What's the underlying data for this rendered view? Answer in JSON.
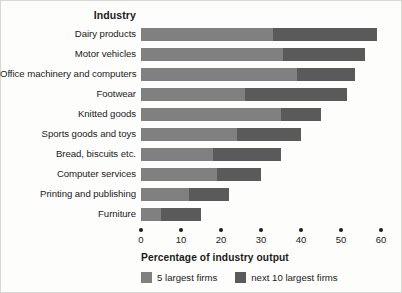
{
  "header": {
    "category_header": "Industry"
  },
  "axis": {
    "title": "Percentage of industry output",
    "ticks": [
      "0",
      "10",
      "20",
      "30",
      "40",
      "50",
      "60"
    ]
  },
  "legend": {
    "items": [
      {
        "label": "5 largest firms",
        "color": "#808080",
        "swatch_name": "legend-swatch-five-largest"
      },
      {
        "label": "next 10 largest firms",
        "color": "#5a5a5a",
        "swatch_name": "legend-swatch-next-ten"
      }
    ]
  },
  "colors": {
    "series_a": "#808080",
    "series_b": "#5a5a5a",
    "text": "#1b1b1b",
    "background": "#fdfdfc"
  },
  "chart_data": {
    "type": "bar",
    "orientation": "horizontal",
    "stacked": true,
    "title": "",
    "xlabel": "Percentage of industry output",
    "ylabel": "Industry",
    "xlim": [
      0,
      60
    ],
    "xticks": [
      0,
      10,
      20,
      30,
      40,
      50,
      60
    ],
    "grid": false,
    "legend_position": "bottom",
    "categories": [
      "Dairy products",
      "Motor vehicles",
      "Office machinery and computers",
      "Footwear",
      "Knitted goods",
      "Sports goods and toys",
      "Bread, biscuits etc.",
      "Computer services",
      "Printing and publishing",
      "Furniture"
    ],
    "series": [
      {
        "name": "5 largest firms",
        "color": "#808080",
        "values": [
          33,
          35.5,
          39,
          26,
          35,
          24,
          18,
          19,
          12,
          5
        ]
      },
      {
        "name": "next 10 largest firms",
        "color": "#5a5a5a",
        "values": [
          26,
          20.5,
          14.5,
          25.5,
          10,
          16,
          17,
          11,
          10,
          10
        ]
      }
    ],
    "totals": [
      59,
      56,
      53.5,
      51.5,
      45,
      40,
      35,
      30,
      22,
      15
    ]
  }
}
